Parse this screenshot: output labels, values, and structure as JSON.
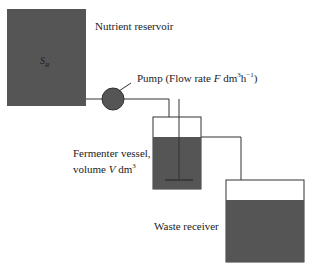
{
  "diagram": {
    "reservoir": {
      "label": "Nutrient reservoir",
      "symbol": "S",
      "subscript": "R"
    },
    "pump": {
      "label_prefix": "Pump (Flow rate ",
      "var": "F",
      "unit": " dm",
      "unit_sup": "3",
      "unit2": "h",
      "unit2_sup": "−1",
      "suffix": ")"
    },
    "fermenter": {
      "line1": "Fermenter vessel,",
      "line2_prefix": "volume ",
      "var": "V",
      "unit": " dm",
      "unit_sup": "3"
    },
    "waste": {
      "label": "Waste receiver"
    },
    "colors": {
      "fill": "#555555",
      "line": "#333333"
    }
  }
}
